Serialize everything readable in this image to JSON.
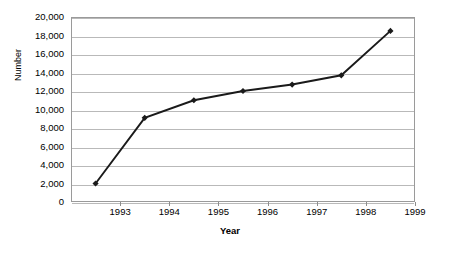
{
  "chart_data": {
    "type": "line",
    "title": "",
    "xlabel": "Year",
    "ylabel": "Number",
    "xlim": [
      1992,
      1999
    ],
    "ylim": [
      0,
      20000
    ],
    "grid": true,
    "legend": false,
    "marker": "diamond",
    "line_color": "#1a1a1a",
    "grid_color": "#b9b9b9",
    "x_tick_labels": [
      "1993",
      "1994",
      "1995",
      "1996",
      "1997",
      "1998",
      "1999"
    ],
    "x_ticks": [
      1993,
      1994,
      1995,
      1996,
      1997,
      1998,
      1999
    ],
    "y_tick_labels": [
      "20,000",
      "18,000",
      "16,000",
      "14,000",
      "12,000",
      "10,000",
      "8,000",
      "6,000",
      "4,000",
      "2,000",
      "0"
    ],
    "y_ticks": [
      20000,
      18000,
      16000,
      14000,
      12000,
      10000,
      8000,
      6000,
      4000,
      2000,
      0
    ],
    "x": [
      1992.5,
      1993.5,
      1994.5,
      1995.5,
      1996.5,
      1997.5,
      1998.5
    ],
    "values": [
      2000,
      9100,
      11000,
      12000,
      12700,
      13700,
      18500
    ]
  }
}
